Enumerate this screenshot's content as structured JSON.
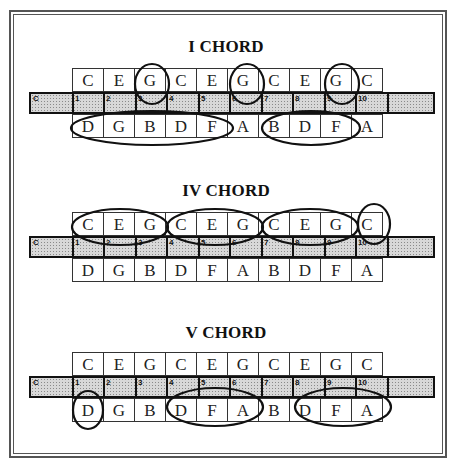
{
  "diagram": {
    "sections": [
      {
        "title": "I CHORD",
        "blow_notes": [
          "C",
          "E",
          "G",
          "C",
          "E",
          "G",
          "C",
          "E",
          "G",
          "C"
        ],
        "draw_notes": [
          "D",
          "G",
          "B",
          "D",
          "F",
          "A",
          "B",
          "D",
          "F",
          "A"
        ],
        "strip_key": "C",
        "hole_numbers": [
          "1",
          "2",
          "3",
          "4",
          "5",
          "6",
          "7",
          "8",
          "9",
          "10"
        ],
        "circled": [
          {
            "row": "blow",
            "holes": [
              3
            ]
          },
          {
            "row": "blow",
            "holes": [
              6
            ]
          },
          {
            "row": "blow",
            "holes": [
              9
            ]
          },
          {
            "row": "draw",
            "holes": [
              1,
              2,
              3,
              4,
              5
            ]
          },
          {
            "row": "draw",
            "holes": [
              7,
              8,
              9
            ]
          }
        ]
      },
      {
        "title": "IV CHORD",
        "blow_notes": [
          "C",
          "E",
          "G",
          "C",
          "E",
          "G",
          "C",
          "E",
          "G",
          "C"
        ],
        "draw_notes": [
          "D",
          "G",
          "B",
          "D",
          "F",
          "A",
          "B",
          "D",
          "F",
          "A"
        ],
        "strip_key": "C",
        "hole_numbers": [
          "1",
          "2",
          "3",
          "4",
          "5",
          "6",
          "7",
          "8",
          "9",
          "10"
        ],
        "circled": [
          {
            "row": "blow",
            "holes": [
              1,
              2,
              3
            ]
          },
          {
            "row": "blow",
            "holes": [
              4,
              5,
              6
            ]
          },
          {
            "row": "blow",
            "holes": [
              7,
              8,
              9
            ]
          },
          {
            "row": "blow",
            "holes": [
              10
            ]
          }
        ]
      },
      {
        "title": "V CHORD",
        "blow_notes": [
          "C",
          "E",
          "G",
          "C",
          "E",
          "G",
          "C",
          "E",
          "G",
          "C"
        ],
        "draw_notes": [
          "D",
          "G",
          "B",
          "D",
          "F",
          "A",
          "B",
          "D",
          "F",
          "A"
        ],
        "strip_key": "C",
        "hole_numbers": [
          "1",
          "2",
          "3",
          "4",
          "5",
          "6",
          "7",
          "8",
          "9",
          "10"
        ],
        "circled": [
          {
            "row": "draw",
            "holes": [
              1
            ]
          },
          {
            "row": "draw",
            "holes": [
              4,
              5,
              6
            ]
          },
          {
            "row": "draw",
            "holes": [
              8,
              9,
              10
            ]
          }
        ]
      }
    ]
  }
}
